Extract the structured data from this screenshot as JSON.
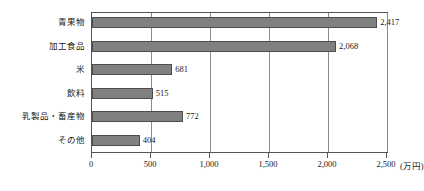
{
  "chart_data": {
    "type": "bar",
    "orientation": "horizontal",
    "title": "",
    "subtitle": "",
    "xlabel": "",
    "ylabel": "",
    "unit_label": "(万円)",
    "categories": [
      "青果物",
      "加工食品",
      "米",
      "飲料",
      "乳製品・畜産物",
      "その他"
    ],
    "values": [
      2417,
      2068,
      681,
      515,
      772,
      404
    ],
    "value_labels": [
      "2,417",
      "2,068",
      "681",
      "515",
      "772",
      "404"
    ],
    "xlim": [
      0,
      2500
    ],
    "xticks": [
      0,
      500,
      1000,
      1500,
      2000,
      2500
    ],
    "xtick_labels": [
      "0",
      "500",
      "1,000",
      "1,500",
      "2,000",
      "2,500"
    ],
    "grid": true,
    "grid_axis": "x",
    "legend": false,
    "colors": {
      "bar_fill": "#808080",
      "bar_border": "#4d4d4d",
      "grid": "#8a8a8a",
      "frame": "#555555",
      "text": "#1a1a1a",
      "background": "#ffffff"
    }
  }
}
